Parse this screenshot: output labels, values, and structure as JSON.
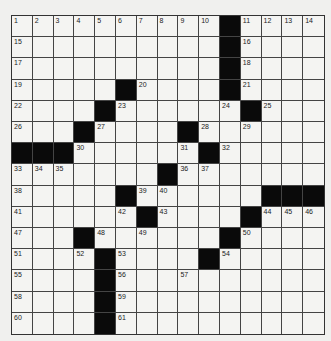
{
  "puzzle": {
    "rows": 15,
    "cols": 15,
    "colors": {
      "black": "#0a0a0a",
      "white": "#f4f4f2",
      "line": "#444444"
    },
    "grid": [
      [
        1,
        2,
        3,
        4,
        5,
        6,
        7,
        8,
        9,
        10,
        "#",
        11,
        12,
        13,
        14
      ],
      [
        15,
        0,
        0,
        0,
        0,
        0,
        0,
        0,
        0,
        0,
        "#",
        16,
        0,
        0,
        0
      ],
      [
        17,
        0,
        0,
        0,
        0,
        0,
        0,
        0,
        0,
        0,
        "#",
        18,
        0,
        0,
        0
      ],
      [
        19,
        0,
        0,
        0,
        0,
        "#",
        20,
        0,
        0,
        0,
        "#",
        21,
        0,
        0,
        0
      ],
      [
        22,
        0,
        0,
        0,
        "#",
        23,
        0,
        0,
        0,
        0,
        24,
        "#",
        25,
        0,
        0
      ],
      [
        26,
        0,
        0,
        "#",
        27,
        0,
        0,
        0,
        "#",
        28,
        0,
        29,
        0,
        0,
        0
      ],
      [
        "#",
        "#",
        "#",
        30,
        0,
        0,
        0,
        0,
        31,
        "#",
        32,
        0,
        0,
        0,
        0
      ],
      [
        33,
        34,
        35,
        0,
        0,
        0,
        0,
        "#",
        36,
        37,
        0,
        0,
        0,
        0,
        0
      ],
      [
        38,
        0,
        0,
        0,
        0,
        "#",
        39,
        40,
        0,
        0,
        0,
        0,
        "#",
        "#",
        "#"
      ],
      [
        41,
        0,
        0,
        0,
        0,
        42,
        "#",
        43,
        0,
        0,
        0,
        "#",
        44,
        45,
        46
      ],
      [
        47,
        0,
        0,
        "#",
        48,
        0,
        49,
        0,
        0,
        0,
        "#",
        50,
        0,
        0,
        0
      ],
      [
        51,
        0,
        0,
        52,
        "#",
        53,
        0,
        0,
        0,
        "#",
        54,
        0,
        0,
        0,
        0
      ],
      [
        55,
        0,
        0,
        0,
        "#",
        56,
        0,
        0,
        57,
        0,
        0,
        0,
        0,
        0,
        0
      ],
      [
        58,
        0,
        0,
        0,
        "#",
        59,
        0,
        0,
        0,
        0,
        0,
        0,
        0,
        0,
        0
      ],
      [
        60,
        0,
        0,
        0,
        "#",
        61,
        0,
        0,
        0,
        0,
        0,
        0,
        0,
        0,
        0
      ]
    ],
    "letters": []
  }
}
